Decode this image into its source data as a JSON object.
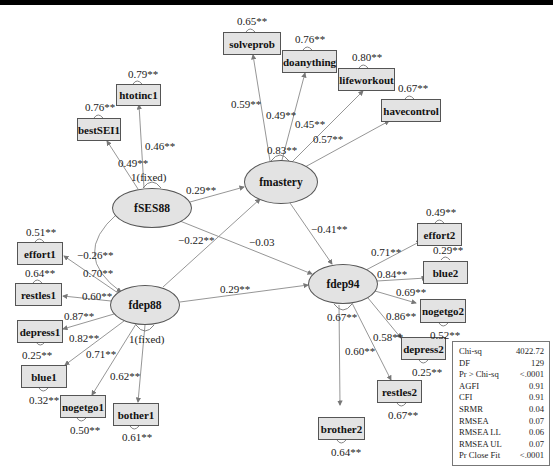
{
  "diagram": {
    "type": "structural-equation-model-path-diagram",
    "latent_factors": [
      {
        "id": "fSES88",
        "label": "fSES88",
        "variance": "1(fixed)"
      },
      {
        "id": "fmastery",
        "label": "fmastery",
        "variance": "0.83**"
      },
      {
        "id": "fdep88",
        "label": "fdep88",
        "variance": "1(fixed)"
      },
      {
        "id": "fdep94",
        "label": "fdep94",
        "variance": "0.67**"
      }
    ],
    "indicators": [
      {
        "id": "solveprob",
        "label": "solveprob",
        "factor": "fmastery",
        "loading": "0.59**",
        "error": "0.65**"
      },
      {
        "id": "doanything",
        "label": "doanything",
        "factor": "fmastery",
        "loading": "0.49**",
        "error": "0.76**"
      },
      {
        "id": "lifeworkout",
        "label": "lifeworkout",
        "factor": "fmastery",
        "loading": "0.45**",
        "error": "0.80**"
      },
      {
        "id": "havecontrol",
        "label": "havecontrol",
        "factor": "fmastery",
        "loading": "0.57**",
        "error": "0.67**"
      },
      {
        "id": "htotinc1",
        "label": "htotinc1",
        "factor": "fSES88",
        "loading": "0.46**",
        "error": "0.79**"
      },
      {
        "id": "bestSEI1",
        "label": "bestSEI1",
        "factor": "fSES88",
        "loading": "0.49**",
        "error": "0.76**"
      },
      {
        "id": "effort1",
        "label": "effort1",
        "factor": "fdep88",
        "loading": "0.70**",
        "error": "0.51**"
      },
      {
        "id": "restles1",
        "label": "restles1",
        "factor": "fdep88",
        "loading": "0.60**",
        "error": "0.64**"
      },
      {
        "id": "depress1",
        "label": "depress1",
        "factor": "fdep88",
        "loading": "0.87**",
        "error": "0.25**"
      },
      {
        "id": "blue1",
        "label": "blue1",
        "factor": "fdep88",
        "loading": "0.82**",
        "error": "0.32**"
      },
      {
        "id": "nogetgo1",
        "label": "nogetgo1",
        "factor": "fdep88",
        "loading": "0.71**",
        "error": "0.50**"
      },
      {
        "id": "bother1",
        "label": "bother1",
        "factor": "fdep88",
        "loading": "0.62**",
        "error": "0.61**"
      },
      {
        "id": "effort2",
        "label": "effort2",
        "factor": "fdep94",
        "loading": "0.71**",
        "error": "0.49**"
      },
      {
        "id": "blue2",
        "label": "blue2",
        "factor": "fdep94",
        "loading": "0.84**",
        "error": "0.29**"
      },
      {
        "id": "nogetgo2",
        "label": "nogetgo2",
        "factor": "fdep94",
        "loading": "0.69**",
        "error": "0.52**"
      },
      {
        "id": "depress2",
        "label": "depress2",
        "factor": "fdep94",
        "loading": "0.86**",
        "error": "0.25**"
      },
      {
        "id": "restles2",
        "label": "restles2",
        "factor": "fdep94",
        "loading": "0.58**",
        "error": "0.67**"
      },
      {
        "id": "brother2",
        "label": "brother2",
        "factor": "fdep94",
        "loading": "0.60**",
        "error": "0.64**"
      }
    ],
    "structural_paths": [
      {
        "from": "fSES88",
        "to": "fmastery",
        "coef": "0.29**"
      },
      {
        "from": "fSES88",
        "to": "fdep94",
        "coef": "-0.03"
      },
      {
        "from": "fdep88",
        "to": "fmastery",
        "coef": "-0.22**"
      },
      {
        "from": "fdep88",
        "to": "fdep94",
        "coef": "0.29**"
      },
      {
        "from": "fmastery",
        "to": "fdep94",
        "coef": "-0.41**"
      }
    ],
    "covariances": [
      {
        "between": [
          "fSES88",
          "fdep88"
        ],
        "coef": "-0.26**"
      }
    ]
  },
  "fit_table": {
    "rows": [
      {
        "name": "Chi-sq",
        "value": "4022.72"
      },
      {
        "name": "DF",
        "value": "129"
      },
      {
        "name": "Pr > Chi-sq",
        "value": "<.0001"
      },
      {
        "name": "AGFI",
        "value": "0.91"
      },
      {
        "name": "CFI",
        "value": "0.91"
      },
      {
        "name": "SRMR",
        "value": "0.04"
      },
      {
        "name": "RMSEA",
        "value": "0.07"
      },
      {
        "name": "RMSEA LL",
        "value": "0.06"
      },
      {
        "name": "RMSEA UL",
        "value": "0.07"
      },
      {
        "name": "Pr Close Fit",
        "value": "<.0001"
      }
    ]
  },
  "labels": {
    "fSES88_var": "1(fixed)",
    "fmastery_var": "0.83**",
    "fdep88_var": "1(fixed)",
    "fdep94_var": "0.67**",
    "ses_mastery": "0.29**",
    "ses_dep94": "−0.03",
    "dep88_mastery": "−0.22**",
    "dep88_dep94": "0.29**",
    "mastery_dep94": "−0.41**",
    "cov_ses_dep88": "−0.26**"
  }
}
